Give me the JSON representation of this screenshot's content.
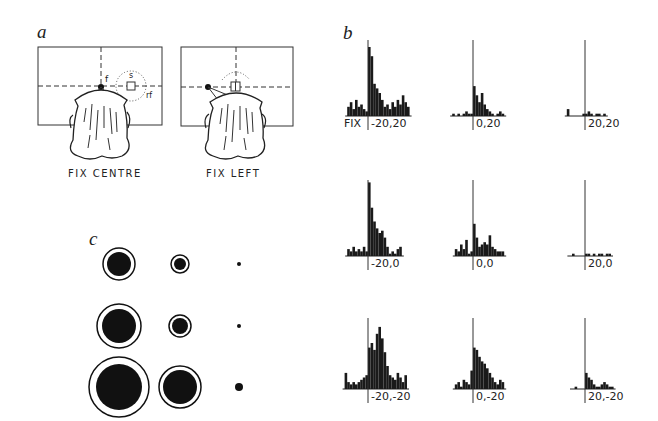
{
  "panels": {
    "a": {
      "letter": "a",
      "left_caption": "FIX CENTRE",
      "right_caption": "FIX LEFT",
      "labels": {
        "fixation": "f",
        "stimulus": "s",
        "receptive_field": "rf"
      }
    },
    "b": {
      "letter": "b",
      "fix_label": "FIX"
    },
    "c": {
      "letter": "c"
    }
  },
  "chart_data": [
    {
      "type": "bar",
      "title": "Panel b: peri-stimulus time histograms at 9 fixation positions",
      "xlabel": "time (aligned at fixation)",
      "ylabel": "spike rate",
      "layout": "3x3 grid",
      "histograms": [
        {
          "label": "-20,20",
          "row": 0,
          "col": 0,
          "pre": [
            4,
            6,
            3,
            7,
            4,
            5,
            3,
            2
          ],
          "post": [
            30,
            26,
            14,
            12,
            10,
            7,
            4,
            5,
            3,
            6,
            4,
            7,
            5,
            9,
            6,
            4
          ]
        },
        {
          "label": "0,20",
          "row": 0,
          "col": 1,
          "pre": [
            1,
            0,
            1,
            0,
            1,
            2,
            1,
            1
          ],
          "post": [
            13,
            9,
            6,
            10,
            5,
            3,
            2,
            1,
            0,
            1,
            2,
            1
          ]
        },
        {
          "label": "20,20",
          "row": 0,
          "col": 2,
          "pre": [
            3,
            0,
            0,
            0,
            0,
            0,
            1
          ],
          "post": [
            1,
            2,
            1,
            0,
            1,
            1,
            0,
            1
          ]
        },
        {
          "label": "-20,0",
          "row": 1,
          "col": 0,
          "pre": [
            3,
            2,
            4,
            2,
            3,
            2,
            4,
            2
          ],
          "post": [
            32,
            21,
            15,
            12,
            10,
            11,
            8,
            4,
            1,
            2,
            1,
            3,
            4
          ]
        },
        {
          "label": "0,0",
          "row": 1,
          "col": 1,
          "pre": [
            3,
            2,
            5,
            3,
            7,
            1,
            2
          ],
          "post": [
            14,
            8,
            4,
            5,
            6,
            5,
            9,
            4,
            3,
            2,
            2,
            2
          ]
        },
        {
          "label": "20,0",
          "row": 1,
          "col": 2,
          "pre": [
            0,
            1,
            0,
            0,
            0,
            0
          ],
          "post": [
            1,
            1,
            0,
            1,
            0,
            1,
            1,
            0,
            1,
            1
          ]
        },
        {
          "label": "-20,-20",
          "row": 2,
          "col": 0,
          "pre": [
            7,
            3,
            2,
            3,
            2,
            3,
            4,
            5,
            6
          ],
          "post": [
            18,
            20,
            17,
            24,
            27,
            22,
            16,
            10,
            6,
            5,
            4,
            7,
            5,
            3,
            6
          ]
        },
        {
          "label": "0,-20",
          "row": 2,
          "col": 1,
          "pre": [
            2,
            3,
            1,
            4,
            3,
            2,
            8
          ],
          "post": [
            18,
            17,
            14,
            12,
            11,
            9,
            7,
            5,
            3,
            2,
            4,
            3
          ]
        },
        {
          "label": "20,-20",
          "row": 2,
          "col": 2,
          "pre": [
            0,
            1,
            0,
            0,
            0
          ],
          "post": [
            7,
            5,
            4,
            2,
            1,
            1,
            2,
            3,
            2,
            1,
            1
          ]
        }
      ]
    },
    {
      "type": "scatter",
      "title": "Panel c: response magnitude (filled) vs. spontaneous + response (rings) at 9 positions",
      "layout": "3x3 grid of concentric discs",
      "discs": [
        {
          "row": 0,
          "col": 0,
          "inner_r": 12,
          "outer_r": 16
        },
        {
          "row": 0,
          "col": 1,
          "inner_r": 6,
          "outer_r": 9
        },
        {
          "row": 0,
          "col": 2,
          "inner_r": 2,
          "outer_r": 0
        },
        {
          "row": 1,
          "col": 0,
          "inner_r": 17,
          "outer_r": 22
        },
        {
          "row": 1,
          "col": 1,
          "inner_r": 8,
          "outer_r": 11
        },
        {
          "row": 1,
          "col": 2,
          "inner_r": 2,
          "outer_r": 0
        },
        {
          "row": 2,
          "col": 0,
          "inner_r": 23,
          "outer_r": 30
        },
        {
          "row": 2,
          "col": 1,
          "inner_r": 17,
          "outer_r": 21
        },
        {
          "row": 2,
          "col": 2,
          "inner_r": 4,
          "outer_r": 0
        }
      ]
    }
  ]
}
